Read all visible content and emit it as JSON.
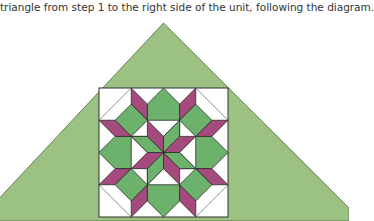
{
  "instruction": {
    "text": "triangle from step 1 to the right side of the unit, following the diagram."
  },
  "diagram": {
    "name": "carpenters-wheel-quilt-block-with-setting-triangle",
    "colors": {
      "setting_triangle": "#9cc283",
      "setting_triangle_stroke": "#4f6b3f",
      "green_piece": "#6cb26c",
      "pink_piece": "#a54a7c",
      "background": "#ffffff",
      "outline": "#2b2b2b"
    }
  }
}
